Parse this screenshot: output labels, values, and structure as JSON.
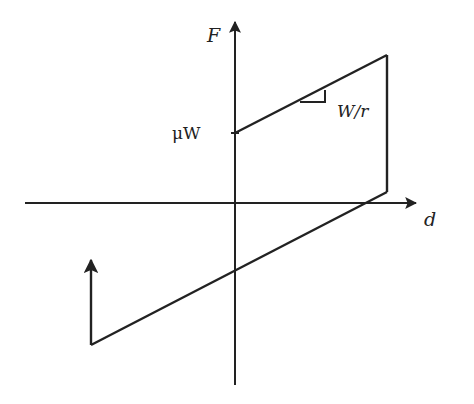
{
  "diagram": {
    "type": "friction-hysteresis-loop",
    "axis_labels": {
      "vertical": "F",
      "horizontal": "d"
    },
    "annotations": {
      "intercept_label": "μW",
      "slope_label": "W/r"
    },
    "colors": {
      "line": "#222222",
      "background": "#ffffff"
    },
    "geometry": {
      "origin": [
        235,
        203
      ],
      "x_axis": [
        [
          25,
          203
        ],
        [
          418,
          203
        ]
      ],
      "y_axis": [
        [
          235,
          385
        ],
        [
          235,
          20
        ]
      ],
      "loop": [
        [
          235,
          133
        ],
        [
          387,
          55
        ],
        [
          387,
          192
        ],
        [
          91,
          345
        ],
        [
          91,
          258
        ]
      ],
      "lower_line_y_intercept": [
        235,
        272
      ],
      "slope_triangle": [
        [
          300,
          102
        ],
        [
          325,
          102
        ],
        [
          325,
          90
        ]
      ]
    }
  }
}
